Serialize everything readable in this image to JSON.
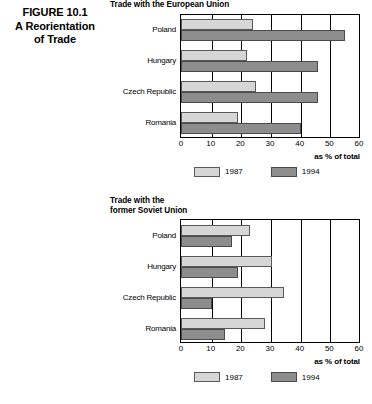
{
  "figure": {
    "caption": "FIGURE 10.1\nA Reorientation\nof Trade"
  },
  "colors": {
    "series_1987": "#d6d6d6",
    "series_1994": "#8d8d8d",
    "axis": "#000000"
  },
  "legend": {
    "items": [
      {
        "label": "1987",
        "swatch": "#d6d6d6"
      },
      {
        "label": "1994",
        "swatch": "#8d8d8d"
      }
    ]
  },
  "axis_note": "as % of total",
  "chart_data": [
    {
      "type": "bar",
      "orientation": "horizontal",
      "title": "Trade with the European Union",
      "categories": [
        "Poland",
        "Hungary",
        "Czech Republic",
        "Romania"
      ],
      "series": [
        {
          "name": "1987",
          "values": [
            24,
            22,
            25,
            19
          ]
        },
        {
          "name": "1994",
          "values": [
            55,
            46,
            46,
            40
          ]
        }
      ],
      "xlabel": "as % of total",
      "ylabel": "",
      "xlim": [
        0,
        60
      ],
      "xticks": [
        0,
        10,
        20,
        30,
        40,
        50,
        60
      ],
      "grid": true,
      "legend_position": "bottom"
    },
    {
      "type": "bar",
      "orientation": "horizontal",
      "title": "Trade with the\nformer Soviet Union",
      "categories": [
        "Poland",
        "Hungary",
        "Czech Republic",
        "Romania"
      ],
      "series": [
        {
          "name": "1987",
          "values": [
            23,
            30.5,
            34.5,
            28
          ]
        },
        {
          "name": "1994",
          "values": [
            17,
            19,
            10,
            14.5
          ]
        }
      ],
      "xlabel": "as % of total",
      "ylabel": "",
      "xlim": [
        0,
        60
      ],
      "xticks": [
        0,
        10,
        20,
        30,
        40,
        50,
        60
      ],
      "grid": true,
      "legend_position": "bottom"
    }
  ]
}
